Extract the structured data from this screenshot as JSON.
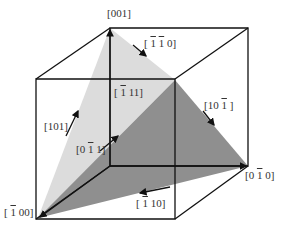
{
  "diagram": {
    "colors": {
      "edge": "#111111",
      "light_plane": "#dcdcdc",
      "dark_plane": "#8f8f8f",
      "label": "#333333",
      "background": "#ffffff"
    },
    "cube": {
      "back_face": [
        [
          110,
          28
        ],
        [
          248,
          28
        ],
        [
          248,
          166
        ],
        [
          110,
          166
        ]
      ],
      "front_face": [
        [
          36,
          79
        ],
        [
          175,
          79
        ],
        [
          175,
          219
        ],
        [
          36,
          219
        ]
      ]
    },
    "planes": [
      {
        "name": "light-plane",
        "points": [
          [
            110,
            28
          ],
          [
            175,
            80
          ],
          [
            38,
            218
          ]
        ],
        "fill": "#dcdcdc"
      },
      {
        "name": "dark-plane",
        "points": [
          [
            175,
            80
          ],
          [
            248,
            166
          ],
          [
            38,
            218
          ]
        ],
        "fill": "#8f8f8f"
      }
    ],
    "labels": {
      "v001": {
        "pre": "[001]",
        "bar": "",
        "post": ""
      },
      "m110": {
        "pre": "[ ",
        "bar": "1",
        "mid": " ",
        "bar2": "1",
        "post": " 0]"
      },
      "m111": {
        "pre": "[ ",
        "bar": "1",
        "post": " 11]"
      },
      "v10m1": {
        "pre": "[10 ",
        "bar": "1",
        "post": " ]"
      },
      "v101": {
        "pre": "[101]",
        "bar": "",
        "post": ""
      },
      "v0m11": {
        "pre": "[0 ",
        "bar": "1",
        "post": " 1]"
      },
      "v0m10": {
        "pre": "[0 ",
        "bar": "1",
        "post": " 0]"
      },
      "vm110": {
        "pre": "[ ",
        "bar": "1",
        "post": " 10]"
      },
      "vm100": {
        "pre": "[ ",
        "bar": "1",
        "post": " 00]"
      }
    }
  }
}
